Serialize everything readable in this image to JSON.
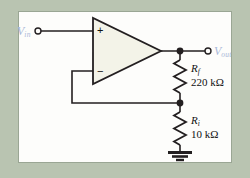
{
  "figure": {
    "background_color": "#b9c4b1",
    "panel_color": "#fdfdfb",
    "wire_color": "#231f20",
    "label_color": "#aab8d8",
    "opamp_fill": "#f3f3e8"
  },
  "input": {
    "symbol": "V",
    "subscript": "in",
    "terminal": "open-circle"
  },
  "output": {
    "symbol": "V",
    "subscript": "out",
    "terminal": "open-circle"
  },
  "opamp": {
    "plus_sign": "+",
    "minus_sign": "−",
    "shape": "triangle"
  },
  "components": [
    {
      "id": "rf",
      "symbol": "R",
      "subscript": "f",
      "value": "220 kΩ",
      "type": "resistor"
    },
    {
      "id": "ri",
      "symbol": "R",
      "subscript": "i",
      "value": "10 kΩ",
      "type": "resistor"
    }
  ],
  "ground": {
    "label": "ground-symbol"
  }
}
